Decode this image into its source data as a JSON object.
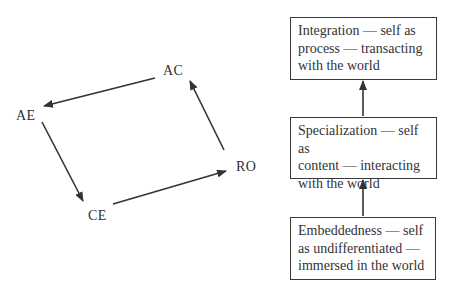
{
  "cycle": {
    "nodes": [
      {
        "id": "AC",
        "label": "AC"
      },
      {
        "id": "AE",
        "label": "AE"
      },
      {
        "id": "CE",
        "label": "CE"
      },
      {
        "id": "RO",
        "label": "RO"
      }
    ],
    "edges": [
      {
        "from": "AC",
        "to": "AE"
      },
      {
        "from": "AE",
        "to": "CE"
      },
      {
        "from": "CE",
        "to": "RO"
      },
      {
        "from": "RO",
        "to": "AC"
      }
    ]
  },
  "stages": [
    {
      "id": "integration",
      "lines": [
        "Integration — self as",
        "process — transacting",
        "with the world"
      ]
    },
    {
      "id": "specialization",
      "lines": [
        "Specialization — self as",
        "content — interacting",
        "with the world"
      ]
    },
    {
      "id": "embeddedness",
      "lines": [
        "Embeddedness — self",
        "as undifferentiated —",
        "immersed in the world"
      ]
    }
  ],
  "stage_flow": [
    {
      "from": "embeddedness",
      "to": "specialization"
    },
    {
      "from": "specialization",
      "to": "integration"
    }
  ],
  "colors": {
    "line": "#333333",
    "text": "#2f2f2f",
    "background": "#ffffff"
  }
}
